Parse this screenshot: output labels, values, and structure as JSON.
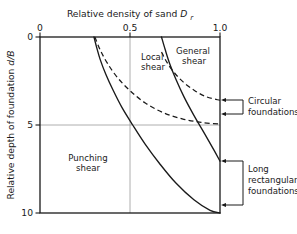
{
  "chart_data": {
    "type": "line",
    "xlabel": "Relative density of sand Dr",
    "ylabel": "Relative depth of foundation d/B",
    "xlabel_main": "Relative density of sand",
    "xlabel_symbol": "D",
    "xlabel_sub": "r",
    "ylabel_main": "Relative depth of foundation",
    "ylabel_symbol": "d/B",
    "xlim": [
      0,
      1.0
    ],
    "ylim": [
      0,
      10
    ],
    "y_inverted": true,
    "grid": true,
    "xticks": [
      0,
      0.5,
      1.0
    ],
    "xtick_labels": [
      "0",
      "0.5",
      "1.0"
    ],
    "yticks": [
      0,
      5,
      10
    ],
    "ytick_labels": [
      "0",
      "5",
      "10"
    ],
    "x_axis_position": "top",
    "legend": "none",
    "series": [
      {
        "name": "Punching/Local boundary - long rectangular foundations",
        "style": "solid",
        "points": [
          [
            0.3,
            0.0
          ],
          [
            0.315,
            0.6
          ],
          [
            0.335,
            1.3
          ],
          [
            0.365,
            2.1
          ],
          [
            0.405,
            3.0
          ],
          [
            0.455,
            4.0
          ],
          [
            0.515,
            5.0
          ],
          [
            0.585,
            6.1
          ],
          [
            0.665,
            7.2
          ],
          [
            0.755,
            8.3
          ],
          [
            0.855,
            9.25
          ],
          [
            0.945,
            9.85
          ],
          [
            1.0,
            10.0
          ]
        ]
      },
      {
        "name": "Punching/Local boundary - circular foundations",
        "style": "dashed",
        "points": [
          [
            0.305,
            0.0
          ],
          [
            0.335,
            0.75
          ],
          [
            0.375,
            1.5
          ],
          [
            0.43,
            2.3
          ],
          [
            0.5,
            3.05
          ],
          [
            0.585,
            3.75
          ],
          [
            0.685,
            4.3
          ],
          [
            0.79,
            4.65
          ],
          [
            0.895,
            4.85
          ],
          [
            1.0,
            4.95
          ]
        ]
      },
      {
        "name": "Local/General boundary - long rectangular foundations",
        "style": "solid",
        "points": [
          [
            0.675,
            0.0
          ],
          [
            0.695,
            0.7
          ],
          [
            0.72,
            1.5
          ],
          [
            0.755,
            2.4
          ],
          [
            0.8,
            3.4
          ],
          [
            0.855,
            4.45
          ],
          [
            0.915,
            5.5
          ],
          [
            0.965,
            6.4
          ],
          [
            1.0,
            7.05
          ]
        ]
      },
      {
        "name": "Local/General boundary - circular foundations",
        "style": "dashed",
        "points": [
          [
            0.675,
            0.85
          ],
          [
            0.7,
            1.35
          ],
          [
            0.74,
            1.95
          ],
          [
            0.795,
            2.55
          ],
          [
            0.86,
            3.05
          ],
          [
            0.925,
            3.4
          ],
          [
            1.0,
            3.6
          ]
        ]
      }
    ],
    "region_labels": [
      {
        "text_line1": "Local",
        "text_line2": "shear",
        "x": 0.565,
        "y": 1.1
      },
      {
        "text_line1": "General",
        "text_line2": "shear",
        "x": 0.835,
        "y": 0.75
      },
      {
        "text_line1": "Punching",
        "text_line2": "shear",
        "x": 0.265,
        "y": 6.85
      }
    ],
    "annotations": [
      {
        "text_line1": "Circular",
        "text_line2": "foundations",
        "bracket_top_y": 3.6,
        "bracket_bottom_y": 4.95,
        "arrows": 2
      },
      {
        "text_line1": "Long",
        "text_line2": "rectangular",
        "text_line3": "foundations",
        "bracket_top_y": 7.05,
        "bracket_bottom_y": 10.0,
        "arrows": 2
      }
    ]
  },
  "colors": {
    "axis": "#1a1a1a",
    "grid": "#9a9a9a",
    "curve": "#1a1a1a",
    "text": "#1a1a1a",
    "background": "#ffffff"
  }
}
